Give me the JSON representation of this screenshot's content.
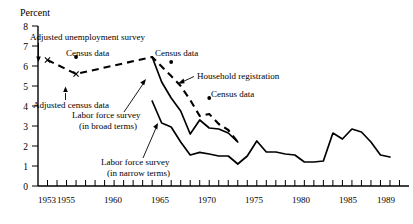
{
  "chart_data": {
    "type": "line",
    "title": "",
    "ylabel": "Percent",
    "xlabel": "",
    "ylim": [
      0,
      8
    ],
    "xlim": [
      1952,
      1991
    ],
    "grid": false,
    "legend_position": "inline-annotations",
    "y_ticks": [
      "0",
      "1",
      "2",
      "3",
      "4",
      "5",
      "6",
      "7",
      "8"
    ],
    "x_ticks": [
      "1953",
      "1955",
      "1960",
      "1965",
      "1970",
      "1975",
      "1980",
      "1985",
      "1989"
    ],
    "x_tick_minor_start": 1953,
    "x_tick_minor_end": 1990,
    "series": [
      {
        "name": "Household registration",
        "style": "dashed",
        "x": [
          1953,
          1956,
          1964,
          1966,
          1967,
          1968,
          1969,
          1970,
          1971,
          1972,
          1973
        ],
        "values": [
          6.3,
          5.6,
          6.45,
          5.5,
          5.0,
          4.3,
          3.5,
          3.6,
          3.1,
          2.8,
          2.2
        ]
      },
      {
        "name": "Labor force survey (in broad terms)",
        "style": "solid",
        "x": [
          1964,
          1965,
          1966,
          1967,
          1968,
          1969,
          1970,
          1971,
          1972,
          1973
        ],
        "values": [
          6.45,
          5.2,
          4.4,
          3.75,
          2.6,
          3.3,
          2.9,
          2.85,
          2.65,
          2.2
        ]
      },
      {
        "name": "Labor force survey (in narrow terms)",
        "style": "solid",
        "x": [
          1964,
          1965,
          1966,
          1967,
          1968,
          1969,
          1970,
          1971,
          1972,
          1973,
          1974,
          1975,
          1976,
          1977,
          1978,
          1979,
          1980,
          1981,
          1982,
          1983,
          1984,
          1985,
          1986,
          1987,
          1988,
          1989
        ],
        "values": [
          4.25,
          3.15,
          2.95,
          2.2,
          1.55,
          1.68,
          1.6,
          1.5,
          1.5,
          1.1,
          1.5,
          2.25,
          1.7,
          1.7,
          1.6,
          1.55,
          1.2,
          1.2,
          1.25,
          2.65,
          2.35,
          2.85,
          2.7,
          2.2,
          1.55,
          1.45
        ]
      }
    ],
    "markers": [
      {
        "label": "Adjusted unemployment survey",
        "type": "x",
        "x": 1953,
        "y": 6.3
      },
      {
        "label": "Adjusted census data",
        "type": "x",
        "x": 1956,
        "y": 5.6
      },
      {
        "label": "Census data",
        "type": "dot",
        "x": 1956,
        "y": 6.45
      },
      {
        "label": "Census data",
        "type": "dot",
        "x": 1966,
        "y": 6.2
      },
      {
        "label": "Census data",
        "type": "dot",
        "x": 1970,
        "y": 4.4
      }
    ],
    "annotations": [
      {
        "id": "adjusted-unemployment-survey",
        "text": "Adjusted unemployment survey"
      },
      {
        "id": "adjusted-census-data",
        "text": "Adjusted census data"
      },
      {
        "id": "census-data-left",
        "text": "Census data"
      },
      {
        "id": "census-data-top",
        "text": "Census data"
      },
      {
        "id": "census-data-right",
        "text": "Census data"
      },
      {
        "id": "household-registration",
        "text": "Household registration"
      },
      {
        "id": "labor-force-survey-broad-line1",
        "text": "Labor force survey"
      },
      {
        "id": "labor-force-survey-broad-line2",
        "text": "(in broad terms)"
      },
      {
        "id": "labor-force-survey-narrow-line1",
        "text": "Labor force survey"
      },
      {
        "id": "labor-force-survey-narrow-line2",
        "text": "(in narrow terms)"
      }
    ]
  }
}
